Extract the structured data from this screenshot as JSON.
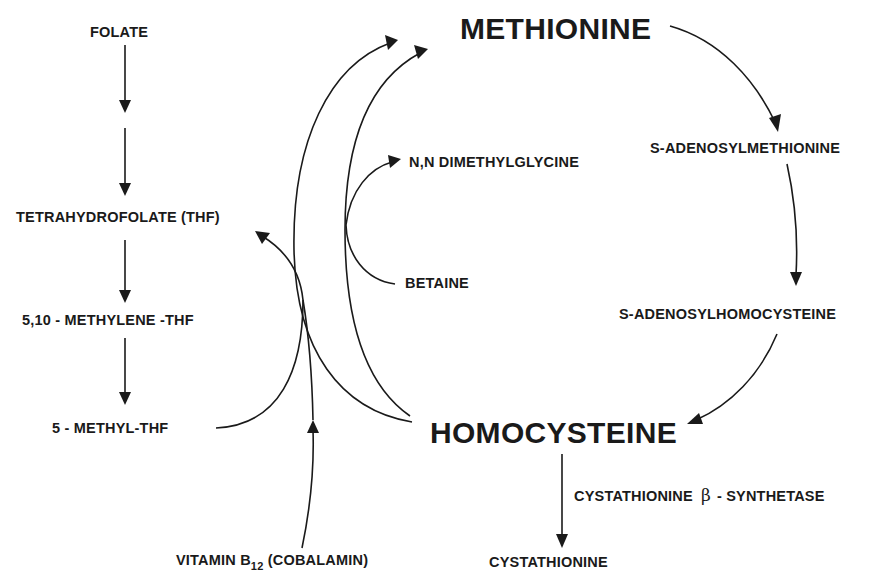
{
  "diagram": {
    "nodes": {
      "folate": "FOLATE",
      "thf": "TETRAHYDROFOLATE (THF)",
      "methylene_thf": "5,10 - METHYLENE -THF",
      "methyl_thf": "5 - METHYL-THF",
      "methionine": "METHIONINE",
      "dmg": "N,N DIMETHYLGLYCINE",
      "betaine": "BETAINE",
      "sam": "S-ADENOSYLMETHIONINE",
      "sah": "S-ADENOSYLHOMOCYSTEINE",
      "homocysteine": "HOMOCYSTEINE",
      "cystathionine": "CYSTATHIONINE",
      "b12_prefix": "VITAMIN B",
      "b12_sub": "12",
      "b12_suffix": " (COBALAMIN)"
    },
    "enzymes": {
      "cbs_prefix": "CYSTATHIONINE",
      "cbs_greek": "β",
      "cbs_suffix": "- SYNTHETASE"
    },
    "edges": [
      {
        "from": "FOLATE",
        "to": "(intermediate)"
      },
      {
        "from": "(intermediate)",
        "to": "TETRAHYDROFOLATE (THF)"
      },
      {
        "from": "TETRAHYDROFOLATE (THF)",
        "to": "5,10 - METHYLENE -THF"
      },
      {
        "from": "5,10 - METHYLENE -THF",
        "to": "5 - METHYL-THF"
      },
      {
        "from": "5 - METHYL-THF",
        "to": "TETRAHYDROFOLATE (THF)"
      },
      {
        "from": "HOMOCYSTEINE",
        "to": "METHIONINE",
        "via": "5 - METHYL-THF / VITAMIN B12"
      },
      {
        "from": "HOMOCYSTEINE",
        "to": "METHIONINE",
        "via": "BETAINE"
      },
      {
        "from": "BETAINE",
        "to": "N,N DIMETHYLGLYCINE"
      },
      {
        "from": "VITAMIN B12 (COBALAMIN)",
        "to": "remethylation"
      },
      {
        "from": "METHIONINE",
        "to": "S-ADENOSYLMETHIONINE"
      },
      {
        "from": "S-ADENOSYLMETHIONINE",
        "to": "S-ADENOSYLHOMOCYSTEINE"
      },
      {
        "from": "S-ADENOSYLHOMOCYSTEINE",
        "to": "HOMOCYSTEINE"
      },
      {
        "from": "HOMOCYSTEINE",
        "to": "CYSTATHIONINE",
        "enzyme": "CYSTATHIONINE β - SYNTHETASE"
      }
    ],
    "colors": {
      "ink": "#1a1a1a",
      "background": "#ffffff"
    }
  }
}
